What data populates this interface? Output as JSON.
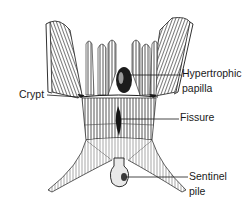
{
  "diagram": {
    "colors": {
      "ink": "#1a1a1a",
      "shade": "#555555",
      "background": "#ffffff"
    },
    "labels": [
      {
        "id": "crypt",
        "lines": [
          "Crypt"
        ],
        "x": 19,
        "y": 88,
        "leader": {
          "x1": 47,
          "y1": 95,
          "x2": 79,
          "y2": 97
        }
      },
      {
        "id": "hypertrophic-papilla",
        "lines": [
          "Hypertrophic",
          "papilla"
        ],
        "x": 182,
        "y": 67,
        "leader": {
          "x1": 128,
          "y1": 75,
          "x2": 181,
          "y2": 75
        }
      },
      {
        "id": "fissure",
        "lines": [
          "Fissure"
        ],
        "x": 180,
        "y": 111,
        "leader": {
          "x1": 121,
          "y1": 119,
          "x2": 179,
          "y2": 119
        }
      },
      {
        "id": "sentinel-pile",
        "lines": [
          "Sentinel",
          "pile"
        ],
        "x": 189,
        "y": 170,
        "leader": {
          "x1": 126,
          "y1": 177,
          "x2": 188,
          "y2": 177
        }
      }
    ]
  }
}
